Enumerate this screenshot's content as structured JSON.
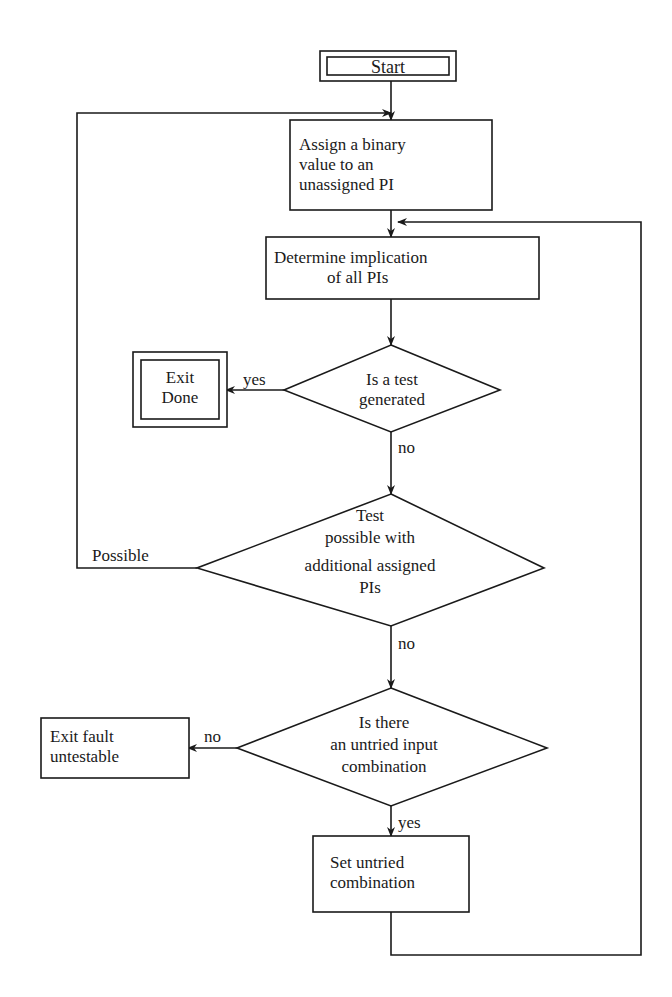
{
  "diagram": {
    "type": "flowchart",
    "nodes": {
      "start": {
        "kind": "terminal",
        "text": "Start"
      },
      "assign": {
        "kind": "process",
        "lines": [
          "Assign a binary",
          "value to an",
          "unassigned PI"
        ]
      },
      "determine": {
        "kind": "process",
        "lines": [
          "Determine implication",
          "of all PIs"
        ]
      },
      "test_generated": {
        "kind": "decision",
        "lines": [
          "Is a test",
          "generated"
        ]
      },
      "exit_done": {
        "kind": "terminal",
        "lines": [
          "Exit",
          "Done"
        ]
      },
      "test_possible": {
        "kind": "decision",
        "lines": [
          "Test",
          "possible with",
          "additional assigned",
          "PIs"
        ]
      },
      "untried": {
        "kind": "decision",
        "lines": [
          "Is there",
          "an untried input",
          "combination"
        ]
      },
      "exit_untestable": {
        "kind": "terminal",
        "lines": [
          "Exit fault",
          "untestable"
        ]
      },
      "set_untried": {
        "kind": "process",
        "lines": [
          "Set untried",
          "combination"
        ]
      }
    },
    "edge_labels": {
      "test_generated_yes": "yes",
      "test_generated_no": "no",
      "test_possible_yes": "Possible",
      "test_possible_no": "no",
      "untried_no": "no",
      "untried_yes": "yes"
    },
    "edges": [
      {
        "from": "start",
        "to": "assign"
      },
      {
        "from": "assign",
        "to": "determine"
      },
      {
        "from": "determine",
        "to": "test_generated"
      },
      {
        "from": "test_generated",
        "to": "exit_done",
        "label": "yes"
      },
      {
        "from": "test_generated",
        "to": "test_possible",
        "label": "no"
      },
      {
        "from": "test_possible",
        "to": "assign",
        "label": "Possible"
      },
      {
        "from": "test_possible",
        "to": "untried",
        "label": "no"
      },
      {
        "from": "untried",
        "to": "exit_untestable",
        "label": "no"
      },
      {
        "from": "untried",
        "to": "set_untried",
        "label": "yes"
      },
      {
        "from": "set_untried",
        "to": "determine"
      }
    ]
  }
}
